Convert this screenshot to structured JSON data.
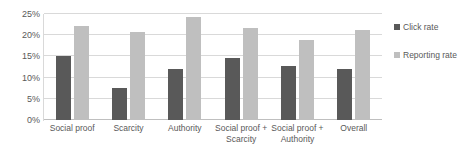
{
  "chart_data": {
    "type": "bar",
    "title": "",
    "xlabel": "",
    "ylabel": "",
    "ylim": [
      0,
      25
    ],
    "ytick_labels": [
      "0%",
      "5%",
      "10%",
      "15%",
      "20%",
      "25%"
    ],
    "ytick_values": [
      0,
      5,
      10,
      15,
      20,
      25
    ],
    "grid": true,
    "legend_position": "right",
    "categories": [
      "Social proof",
      "Scarcity",
      "Authority",
      "Social proof + Scarcity",
      "Social proof + Authority",
      "Overall"
    ],
    "series": [
      {
        "name": "Click rate",
        "color": "#595959",
        "values": [
          15.0,
          7.6,
          12.0,
          14.7,
          12.8,
          12.0
        ]
      },
      {
        "name": "Reporting rate",
        "color": "#bfbfbf",
        "values": [
          22.2,
          20.8,
          24.4,
          21.8,
          18.9,
          21.3
        ]
      }
    ]
  },
  "legend": {
    "items": [
      {
        "label": "Click rate",
        "color": "#595959"
      },
      {
        "label": "Reporting rate",
        "color": "#bfbfbf"
      }
    ]
  },
  "colors": {
    "click_rate": "#595959",
    "reporting_rate": "#bfbfbf",
    "gridline": "#d9d9d9",
    "text": "#595959",
    "background": "#ffffff"
  }
}
